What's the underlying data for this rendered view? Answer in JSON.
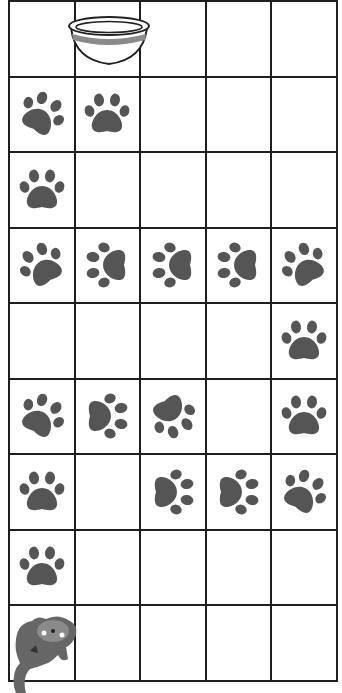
{
  "game": {
    "type": "grid-path-puzzle",
    "rows": 9,
    "cols": 5,
    "colors": {
      "grid_line": "#1e1e1e",
      "paw": "#555555",
      "background": "#ffffff",
      "bowl_stripe": "#8a8a8a",
      "cat": "#666666"
    },
    "start": {
      "row": 8,
      "col": 0,
      "item": "cat"
    },
    "goal": {
      "row": 0,
      "col": 1,
      "item": "food-bowl"
    },
    "paws": [
      {
        "row": 1,
        "col": 0,
        "rotation": 30
      },
      {
        "row": 1,
        "col": 1,
        "rotation": 0
      },
      {
        "row": 2,
        "col": 0,
        "rotation": 0
      },
      {
        "row": 3,
        "col": 0,
        "rotation": -30
      },
      {
        "row": 3,
        "col": 1,
        "rotation": -90
      },
      {
        "row": 3,
        "col": 2,
        "rotation": -90
      },
      {
        "row": 3,
        "col": 3,
        "rotation": -90
      },
      {
        "row": 3,
        "col": 4,
        "rotation": -30
      },
      {
        "row": 4,
        "col": 4,
        "rotation": 0
      },
      {
        "row": 5,
        "col": 0,
        "rotation": 30
      },
      {
        "row": 5,
        "col": 1,
        "rotation": 90
      },
      {
        "row": 5,
        "col": 2,
        "rotation": 150
      },
      {
        "row": 5,
        "col": 4,
        "rotation": 0
      },
      {
        "row": 6,
        "col": 0,
        "rotation": 0
      },
      {
        "row": 6,
        "col": 2,
        "rotation": 90
      },
      {
        "row": 6,
        "col": 3,
        "rotation": 90
      },
      {
        "row": 6,
        "col": 4,
        "rotation": 30
      },
      {
        "row": 7,
        "col": 0,
        "rotation": 0
      }
    ]
  }
}
